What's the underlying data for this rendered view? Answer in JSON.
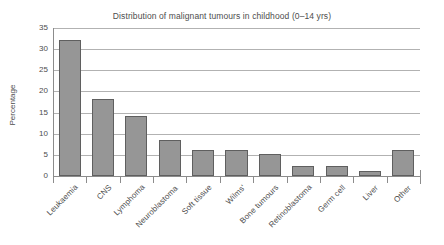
{
  "chart_data": {
    "type": "bar",
    "title": "Distribution of malignant tumours in childhood (0–14 yrs)",
    "xlabel": "",
    "ylabel": "Percentage",
    "ylim": [
      0,
      35
    ],
    "yticks": [
      0,
      5,
      10,
      15,
      20,
      25,
      30,
      35
    ],
    "ytick_labels": [
      "0",
      "5",
      "10",
      "15",
      "20",
      "25",
      "30",
      "35"
    ],
    "grid": true,
    "grid_axis": "y",
    "legend": false,
    "bar_color": "#969696",
    "bar_edge_color": "#5f5f5f",
    "categories": [
      "Leukaemia",
      "CNS",
      "Lymphoma",
      "Neuroblastoma",
      "Soft tissue",
      "Wilms'",
      "Bone tumours",
      "Retinoblastoma",
      "Germ cell",
      "Liver",
      "Other"
    ],
    "values": [
      32.2,
      18.2,
      14.2,
      8.4,
      6.2,
      6.2,
      5.3,
      2.3,
      2.3,
      1.3,
      6.2
    ],
    "xtick_label_rotation": -45
  }
}
